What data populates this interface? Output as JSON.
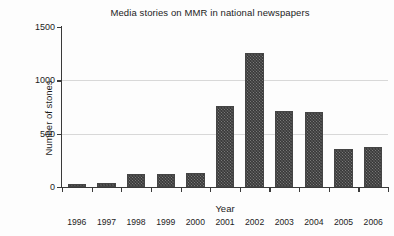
{
  "chart_data": {
    "type": "bar",
    "title": "Media stories on MMR in national newspapers",
    "xlabel": "Year",
    "ylabel": "Number of stones",
    "categories": [
      "1996",
      "1997",
      "1998",
      "1999",
      "2000",
      "2001",
      "2002",
      "2003",
      "2004",
      "2005",
      "2006"
    ],
    "values": [
      30,
      40,
      120,
      125,
      130,
      760,
      1255,
      710,
      700,
      355,
      375
    ],
    "ylim": [
      0,
      1500
    ],
    "yticks": [
      0,
      500,
      1000,
      1500
    ],
    "ytick_labels": [
      "0",
      "500",
      "1000",
      "1500"
    ],
    "grid": true,
    "legend": null,
    "series_color": "#787878"
  }
}
